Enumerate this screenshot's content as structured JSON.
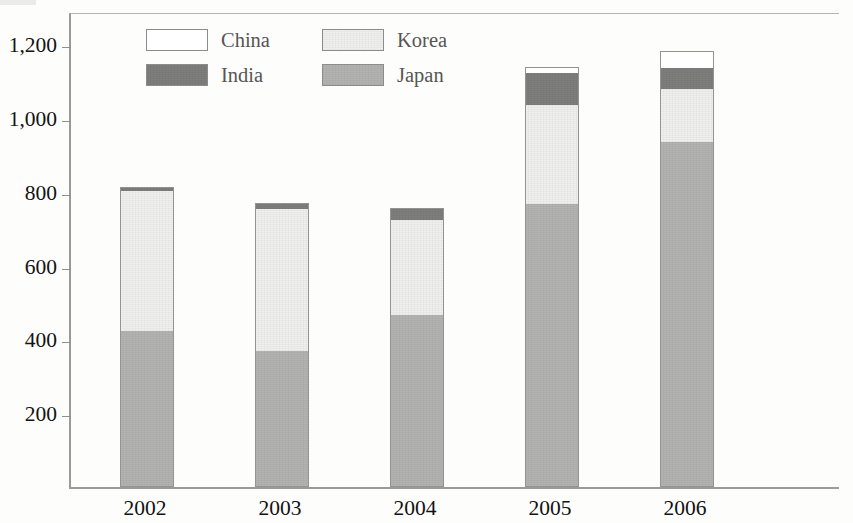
{
  "chart_data": {
    "type": "bar",
    "stacked": true,
    "title": "",
    "subtitle": "",
    "xlabel": "",
    "ylabel": "",
    "categories": [
      "2002",
      "2003",
      "2004",
      "2005",
      "2006"
    ],
    "ylim": [
      0,
      1290
    ],
    "yticks": [
      200,
      400,
      600,
      800,
      1000,
      1200
    ],
    "ytick_labels": [
      "200",
      "400",
      "600",
      "800",
      "1,000",
      "1,200"
    ],
    "grid": false,
    "legend_position": "top-left-inside",
    "stack_order_bottom_to_top": [
      "Japan",
      "Korea",
      "India",
      "China"
    ],
    "series": [
      {
        "name": "Japan",
        "color": "#b3b3b1",
        "values": [
          424,
          368,
          465,
          768,
          935
        ]
      },
      {
        "name": "Korea",
        "color": "#f0f0ee",
        "values": [
          377,
          385,
          259,
          268,
          144
        ]
      },
      {
        "name": "India",
        "color": "#7e7e7c",
        "values": [
          12,
          18,
          32,
          85,
          56
        ]
      },
      {
        "name": "China",
        "color": "#ffffff",
        "values": [
          0,
          0,
          0,
          18,
          47
        ]
      }
    ],
    "totals": [
      813,
      771,
      756,
      1139,
      1182
    ]
  },
  "legend": {
    "items": [
      {
        "label": "China",
        "color": "#ffffff",
        "swatch": "legend-swatch-china"
      },
      {
        "label": "Korea",
        "color": "#f0f0ee",
        "swatch": "legend-swatch-korea"
      },
      {
        "label": "India",
        "color": "#7e7e7c",
        "swatch": "legend-swatch-india"
      },
      {
        "label": "Japan",
        "color": "#b3b3b1",
        "swatch": "legend-swatch-japan"
      }
    ]
  },
  "axis": {
    "y_labels": [
      "1,200",
      "1,000",
      "800",
      "600",
      "400",
      "200"
    ],
    "x_labels": [
      "2002",
      "2003",
      "2004",
      "2005",
      "2006"
    ]
  },
  "colors": {
    "frame": "#9a9a98",
    "tick": "#8e8e8c",
    "text": "#131313",
    "legend_text": "#565654",
    "background": "#fdfdfc"
  }
}
